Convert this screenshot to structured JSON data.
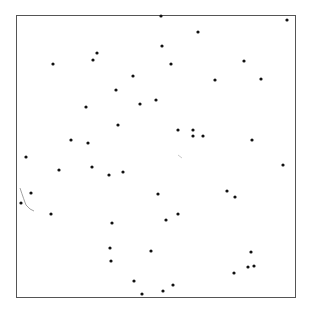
{
  "figure": {
    "frame": {
      "x": 16,
      "y": 15,
      "width": 280,
      "height": 283,
      "stroke": "#555555"
    },
    "dot_color": "#111111",
    "dot_radius": 1.6,
    "points": [
      [
        161,
        16
      ],
      [
        287,
        20
      ],
      [
        198,
        32
      ],
      [
        97,
        53
      ],
      [
        93,
        60
      ],
      [
        162,
        46
      ],
      [
        53,
        64
      ],
      [
        171,
        64
      ],
      [
        244,
        61
      ],
      [
        133,
        76
      ],
      [
        215,
        80
      ],
      [
        261,
        79
      ],
      [
        116,
        90
      ],
      [
        156,
        100
      ],
      [
        140,
        104
      ],
      [
        86,
        107
      ],
      [
        118,
        125
      ],
      [
        178,
        130
      ],
      [
        193,
        130
      ],
      [
        193,
        136
      ],
      [
        203,
        136
      ],
      [
        71,
        140
      ],
      [
        88,
        143
      ],
      [
        252,
        140
      ],
      [
        26,
        157
      ],
      [
        283,
        165
      ],
      [
        92,
        167
      ],
      [
        59,
        170
      ],
      [
        123,
        172
      ],
      [
        109,
        175
      ],
      [
        31,
        193
      ],
      [
        158,
        194
      ],
      [
        227,
        191
      ],
      [
        235,
        197
      ],
      [
        21,
        203
      ],
      [
        51,
        214
      ],
      [
        178,
        214
      ],
      [
        166,
        220
      ],
      [
        112,
        223
      ],
      [
        110,
        248
      ],
      [
        151,
        251
      ],
      [
        251,
        252
      ],
      [
        111,
        261
      ],
      [
        248,
        267
      ],
      [
        254,
        266
      ],
      [
        234,
        273
      ],
      [
        134,
        281
      ],
      [
        173,
        285
      ],
      [
        163,
        291
      ],
      [
        142,
        294
      ]
    ],
    "strokes": [
      {
        "d": "M 20 188 Q 24 200 26 205 Q 30 210 34 211",
        "color": "#888888"
      },
      {
        "d": "M 178 155 L 182 158",
        "color": "#bbbbbb"
      }
    ]
  }
}
